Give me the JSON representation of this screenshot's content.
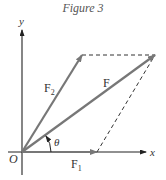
{
  "figure": {
    "caption": "Figure 3",
    "labels": {
      "x_axis": "x",
      "y_axis": "y",
      "origin": "O",
      "F": "F",
      "F1": "F",
      "F1_sub": "1",
      "F2": "F",
      "F2_sub": "2",
      "theta": "θ"
    },
    "colors": {
      "vector": "#777777",
      "axis": "#222222",
      "dashed": "#333333"
    },
    "geometry": {
      "origin": [
        22,
        152
      ],
      "F1_tip": [
        97,
        152
      ],
      "F2_tip": [
        82,
        55
      ],
      "F_tip": [
        155,
        55
      ]
    }
  }
}
